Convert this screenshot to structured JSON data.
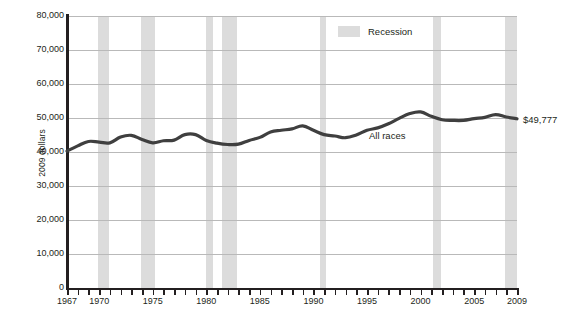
{
  "chart_data": {
    "type": "line",
    "title": "",
    "subtitle": "",
    "xlabel": "",
    "ylabel": "2009 dollars",
    "xlim": [
      1967,
      2009
    ],
    "ylim": [
      0,
      80000
    ],
    "grid": true,
    "legend_position": "top-right",
    "y_ticks": [
      {
        "value": 80000,
        "label": "80,000"
      },
      {
        "value": 70000,
        "label": "70,000"
      },
      {
        "value": 60000,
        "label": "60,000"
      },
      {
        "value": 50000,
        "label": "50,000"
      },
      {
        "value": 40000,
        "label": "40,000"
      },
      {
        "value": 30000,
        "label": "30,000"
      },
      {
        "value": 20000,
        "label": "20,000"
      },
      {
        "value": 10000,
        "label": "10,000"
      },
      {
        "value": 0,
        "label": "0"
      }
    ],
    "x_tick_labels": [
      {
        "value": 1967,
        "label": "1967"
      },
      {
        "value": 1970,
        "label": "1970"
      },
      {
        "value": 1975,
        "label": "1975"
      },
      {
        "value": 1980,
        "label": "1980"
      },
      {
        "value": 1985,
        "label": "1985"
      },
      {
        "value": 1990,
        "label": "1990"
      },
      {
        "value": 1995,
        "label": "1995"
      },
      {
        "value": 2000,
        "label": "2000"
      },
      {
        "value": 2005,
        "label": "2005"
      },
      {
        "value": 2009,
        "label": "2009"
      }
    ],
    "x_tick_values": [
      1967,
      1968,
      1969,
      1970,
      1971,
      1972,
      1973,
      1974,
      1975,
      1976,
      1977,
      1978,
      1979,
      1980,
      1981,
      1982,
      1983,
      1984,
      1985,
      1986,
      1987,
      1988,
      1989,
      1990,
      1991,
      1992,
      1993,
      1994,
      1995,
      1996,
      1997,
      1998,
      1999,
      2000,
      2001,
      2002,
      2003,
      2004,
      2005,
      2006,
      2007,
      2008,
      2009
    ],
    "legend": [
      {
        "name": "Recession",
        "color": "#dcdcdc",
        "type": "band"
      }
    ],
    "series": [
      {
        "name": "All races",
        "color": "#3f3f3f",
        "label_annotation": "All races",
        "end_value_label": "$49,777",
        "x": [
          1967,
          1968,
          1969,
          1970,
          1971,
          1972,
          1973,
          1974,
          1975,
          1976,
          1977,
          1978,
          1979,
          1980,
          1981,
          1982,
          1983,
          1984,
          1985,
          1986,
          1987,
          1988,
          1989,
          1990,
          1991,
          1992,
          1993,
          1994,
          1995,
          1996,
          1997,
          1998,
          1999,
          2000,
          2001,
          2002,
          2003,
          2004,
          2005,
          2006,
          2007,
          2008,
          2009
        ],
        "values": [
          40261,
          41800,
          43100,
          42900,
          42700,
          44400,
          44900,
          43700,
          42700,
          43300,
          43500,
          45100,
          45100,
          43400,
          42600,
          42200,
          42300,
          43400,
          44300,
          45900,
          46400,
          46800,
          47700,
          46400,
          45100,
          44700,
          44200,
          45000,
          46400,
          47100,
          48300,
          49900,
          51300,
          51800,
          50500,
          49500,
          49300,
          49300,
          49800,
          50200,
          51000,
          50300,
          49777
        ]
      }
    ],
    "recession_bands": [
      {
        "start": 1969.9,
        "end": 1970.9
      },
      {
        "start": 1973.9,
        "end": 1975.2
      },
      {
        "start": 1980.0,
        "end": 1980.6
      },
      {
        "start": 1981.5,
        "end": 1982.9
      },
      {
        "start": 1990.6,
        "end": 1991.2
      },
      {
        "start": 2001.2,
        "end": 2001.9
      },
      {
        "start": 2007.9,
        "end": 2009.0
      }
    ]
  },
  "annotations": {
    "y_axis_title": "2009 dollars",
    "series_inline_label": "All races",
    "end_value": "$49,777",
    "legend_recession": "Recession"
  }
}
